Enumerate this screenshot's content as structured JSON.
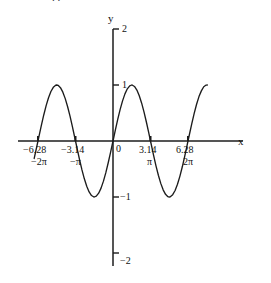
{
  "figure": {
    "background": "#ffffff",
    "curve_color": "#1c1c1c",
    "axis_color": "#1c1c1c",
    "top_fragment": ". ."
  },
  "axes": {
    "x_axis_label": "x",
    "y_axis_label": "y",
    "origin_label": "0"
  },
  "x_ticks": [
    {
      "value": "−6.28",
      "sub": "−2π",
      "num": -6.283185
    },
    {
      "value": "−3.14",
      "sub": "−π",
      "num": -3.141593
    },
    {
      "value": "3.14",
      "sub": "π",
      "num": 3.141593
    },
    {
      "value": "6.28",
      "sub": "2π",
      "num": 6.283185
    }
  ],
  "y_ticks": [
    {
      "label": "2",
      "num": 2
    },
    {
      "label": "1",
      "num": 1
    },
    {
      "label": "−1",
      "num": -1
    },
    {
      "label": "−2",
      "num": -2
    }
  ],
  "chart_data": {
    "type": "line",
    "title": "",
    "subtitle": "",
    "xlabel": "x",
    "ylabel": "y",
    "xlim": [
      -7.6,
      8.2
    ],
    "ylim": [
      -2,
      2
    ],
    "grid": false,
    "legend": null,
    "function": "y = sin(x)",
    "series": [
      {
        "name": "sin(x)",
        "color": "#1c1c1c",
        "x": [
          -6.6,
          -6.4,
          -6.2,
          -6.0,
          -5.8,
          -5.6,
          -5.4,
          -5.2,
          -5.0,
          -4.8,
          -4.71,
          -4.6,
          -4.4,
          -4.2,
          -4.0,
          -3.8,
          -3.6,
          -3.4,
          -3.2,
          -3.14,
          -3.0,
          -2.8,
          -2.6,
          -2.4,
          -2.2,
          -2.0,
          -1.8,
          -1.6,
          -1.57,
          -1.4,
          -1.2,
          -1.0,
          -0.8,
          -0.6,
          -0.4,
          -0.2,
          0.0,
          0.2,
          0.4,
          0.6,
          0.8,
          1.0,
          1.2,
          1.4,
          1.57,
          1.6,
          1.8,
          2.0,
          2.2,
          2.4,
          2.6,
          2.8,
          3.0,
          3.14,
          3.2,
          3.4,
          3.6,
          3.8,
          4.0,
          4.2,
          4.4,
          4.6,
          4.71,
          4.8,
          5.0,
          5.2,
          5.4,
          5.6,
          5.8,
          6.0,
          6.2,
          6.28,
          6.4,
          6.6,
          6.8,
          7.0,
          7.2,
          7.4,
          7.6,
          7.8,
          7.9
        ],
        "y": [
          -0.312,
          -0.116,
          0.083,
          0.279,
          0.465,
          0.631,
          0.773,
          0.884,
          0.959,
          0.996,
          1.0,
          0.994,
          0.952,
          0.872,
          0.757,
          0.612,
          0.443,
          0.256,
          0.058,
          0.0,
          -0.141,
          -0.335,
          -0.516,
          -0.675,
          -0.808,
          -0.909,
          -0.974,
          -1.0,
          -1.0,
          -0.985,
          -0.932,
          -0.841,
          -0.717,
          -0.565,
          -0.389,
          -0.199,
          0.0,
          0.199,
          0.389,
          0.565,
          0.717,
          0.841,
          0.932,
          0.985,
          1.0,
          1.0,
          0.974,
          0.909,
          0.808,
          0.675,
          0.516,
          0.335,
          0.141,
          0.0,
          -0.058,
          -0.256,
          -0.443,
          -0.612,
          -0.757,
          -0.872,
          -0.952,
          -0.994,
          -1.0,
          -0.996,
          -0.959,
          -0.884,
          -0.773,
          -0.631,
          -0.465,
          -0.279,
          -0.083,
          0.0,
          0.116,
          0.312,
          0.492,
          0.657,
          0.793,
          0.895,
          0.969,
          0.999,
          1.0
        ]
      }
    ]
  }
}
